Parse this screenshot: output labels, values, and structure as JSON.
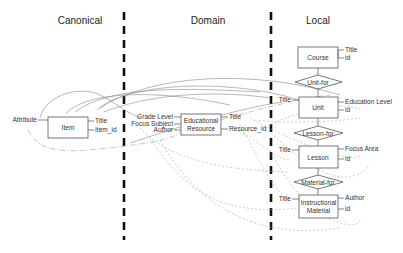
{
  "columns": [
    {
      "label": "Canonical"
    },
    {
      "label": "Domain"
    },
    {
      "label": "Local"
    }
  ],
  "canonical": {
    "entity": "Item",
    "left_attributes": [
      "Attribute"
    ],
    "right_attributes": [
      "Title",
      "Item_id"
    ]
  },
  "domain": {
    "entity_line1": "Educational",
    "entity_line2": "Resource",
    "left_attributes": [
      "Grade Level",
      "Focus Subject",
      "Author"
    ],
    "right_attributes": [
      "Title",
      "Resource_Id"
    ]
  },
  "local": {
    "entities": [
      {
        "name_line1": "Course",
        "name_line2": "",
        "left_attributes": [],
        "right_attributes": [
          "Title",
          "id"
        ]
      },
      {
        "name_line1": "Unit",
        "name_line2": "",
        "left_attributes": [
          "Title"
        ],
        "right_attributes": [
          "Education Level",
          "id"
        ]
      },
      {
        "name_line1": "Lesson",
        "name_line2": "",
        "left_attributes": [
          "Title"
        ],
        "right_attributes": [
          "Focus Area",
          "id"
        ]
      },
      {
        "name_line1": "Instructional",
        "name_line2": "Material",
        "left_attributes": [
          "Title"
        ],
        "right_attributes": [
          "Author",
          "id"
        ]
      }
    ],
    "relationships": [
      {
        "label": "Unit-for"
      },
      {
        "label": "Lesson-for"
      },
      {
        "label": "Material-for"
      }
    ]
  }
}
